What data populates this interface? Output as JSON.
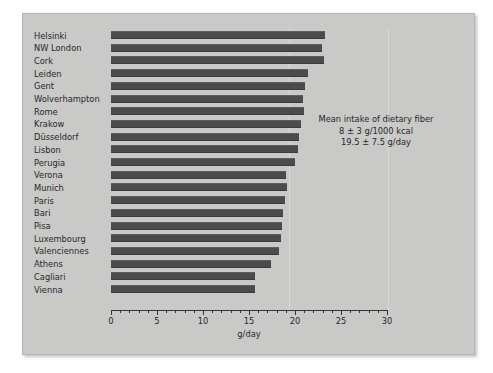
{
  "chart_data": {
    "type": "bar",
    "orientation": "horizontal",
    "title": "",
    "xlabel": "g/day",
    "ylabel": "",
    "xlim": [
      0,
      30
    ],
    "xticks": [
      0,
      5,
      10,
      15,
      20,
      25,
      30
    ],
    "xtick_labels": [
      "0",
      "5",
      "10",
      "15",
      "20",
      "25",
      "30"
    ],
    "minor_tick_step": 1,
    "grid": false,
    "legend": null,
    "bar_color": "#4b4b4d",
    "background_color": "#c9c9c7",
    "categories": [
      "Helsinki",
      "NW London",
      "Cork",
      "Leiden",
      "Gent",
      "Wolverhampton",
      "Rome",
      "Krakow",
      "Düsseldorf",
      "Lisbon",
      "Perugia",
      "Verona",
      "Munich",
      "Paris",
      "Bari",
      "Pisa",
      "Luxembourg",
      "Valenciennes",
      "Athens",
      "Cagliari",
      "Vienna"
    ],
    "values": [
      23.3,
      22.9,
      23.1,
      21.4,
      21.1,
      20.9,
      21.0,
      20.7,
      20.4,
      20.3,
      20.0,
      19.0,
      19.1,
      18.9,
      18.7,
      18.6,
      18.5,
      18.3,
      17.4,
      15.7,
      15.6
    ],
    "annotations": [
      "Mean intake of dietary fiber",
      "8 ± 3 g/1000 kcal",
      "19.5 ± 7.5 g/day"
    ]
  }
}
